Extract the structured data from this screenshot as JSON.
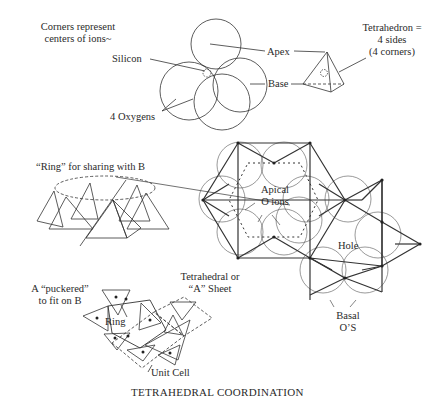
{
  "title": "TETRAHEDRAL COORDINATION",
  "top_section": {
    "note_line1": "Corners represent",
    "note_line2": "centers of ions~",
    "silicon": "Silicon",
    "oxygens": "4 Oxygens",
    "apex": "Apex",
    "base": "Base",
    "tetra_line1": "Tetrahedron =",
    "tetra_line2": "4 sides",
    "tetra_line3": "(4 corners)"
  },
  "middle_section": {
    "ring_label": "“Ring” for sharing with B",
    "apical_line1": "Apical",
    "apical_line2": "O ions",
    "hole": "Hole",
    "sheet_line1": "Tetrahedral or",
    "sheet_line2": "“A” Sheet",
    "basal_line1": "Basal",
    "basal_line2": "O’S"
  },
  "bottom_section": {
    "puckered_line1": "A “puckered”",
    "puckered_line2": "to fit on B",
    "ring": "Ring",
    "unit_cell": "Unit Cell"
  }
}
